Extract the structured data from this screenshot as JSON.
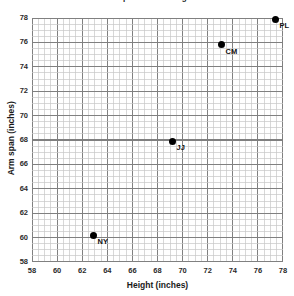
{
  "chart_data": {
    "type": "scatter",
    "title": "Arm span versus height",
    "xlabel": "Height (inches)",
    "ylabel": "Arm span (inches)",
    "xlim": [
      58,
      78
    ],
    "ylim": [
      58,
      78
    ],
    "xticks": [
      58,
      60,
      62,
      64,
      66,
      68,
      70,
      72,
      74,
      76,
      78
    ],
    "yticks": [
      58,
      60,
      62,
      64,
      66,
      68,
      70,
      72,
      74,
      76,
      78
    ],
    "xtick_labels": [
      "58",
      "60",
      "62",
      "64",
      "66",
      "68",
      "70",
      "72",
      "74",
      "76",
      "78"
    ],
    "ytick_labels": [
      "58",
      "60",
      "62",
      "64",
      "66",
      "68",
      "70",
      "72",
      "74",
      "76",
      "78"
    ],
    "grid": true,
    "grid_major_step": 2,
    "grid_minor_step": 0.5,
    "legend": null,
    "marker_color": "#000000",
    "grid_major_color": "#808080",
    "grid_minor_color": "#c8c8c8",
    "points": [
      {
        "label": "NY",
        "x": 62.9,
        "y": 60.2
      },
      {
        "label": "JJ",
        "x": 69.2,
        "y": 67.9
      },
      {
        "label": "CM",
        "x": 73.1,
        "y": 75.8
      },
      {
        "label": "PL",
        "x": 77.4,
        "y": 77.9
      }
    ]
  }
}
